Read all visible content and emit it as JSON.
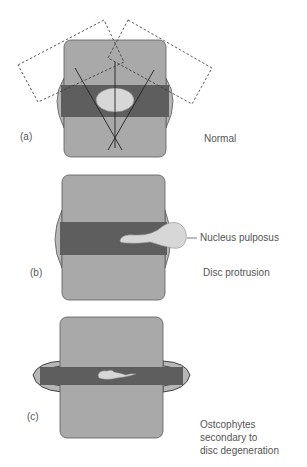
{
  "figure": {
    "panels": [
      {
        "id": "a",
        "marker": "(a)",
        "caption": "Normal"
      },
      {
        "id": "b",
        "marker": "(b)",
        "caption": "Disc protrusion",
        "callout": "Nucleus pulposus"
      },
      {
        "id": "c",
        "marker": "(c)",
        "caption_lines": [
          "Ostcophytes",
          "secondary to",
          "disc degeneration"
        ]
      }
    ]
  },
  "colors": {
    "vertebra": "#a9a9a9",
    "vertebra_outline": "#5a5a5a",
    "disc": "#5e5e5e",
    "annulus_bulge": "#b7b7b7",
    "nucleus": "#d7d7d7",
    "text": "#555555"
  }
}
